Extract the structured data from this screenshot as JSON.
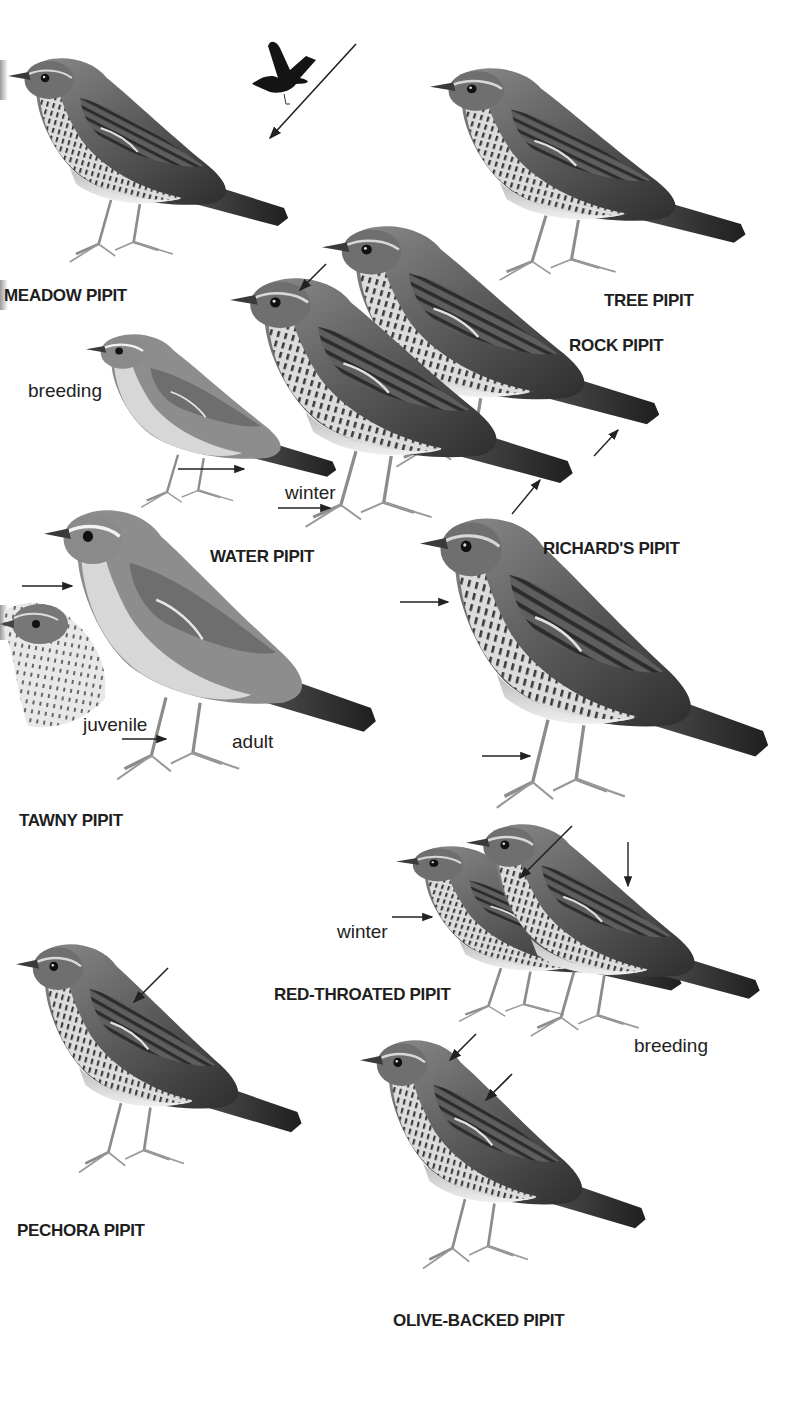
{
  "plate": {
    "background": "#ffffff",
    "ink": "#1e1e1e"
  },
  "species": [
    {
      "id": "meadow",
      "name": "MEADOW PIPIT",
      "label_pos": [
        4,
        286
      ]
    },
    {
      "id": "tree",
      "name": "TREE PIPIT",
      "label_pos": [
        604,
        291
      ]
    },
    {
      "id": "rock",
      "name": "ROCK PIPIT",
      "label_pos": [
        569,
        336
      ]
    },
    {
      "id": "water",
      "name": "WATER PIPIT",
      "label_pos": [
        210,
        547
      ]
    },
    {
      "id": "richards",
      "name": "RICHARD'S PIPIT",
      "label_pos": [
        543,
        539
      ]
    },
    {
      "id": "tawny",
      "name": "TAWNY PIPIT",
      "label_pos": [
        19,
        811
      ]
    },
    {
      "id": "red-throated",
      "name": "RED-THROATED PIPIT",
      "label_pos": [
        274,
        985
      ]
    },
    {
      "id": "pechora",
      "name": "PECHORA PIPIT",
      "label_pos": [
        17,
        1221
      ]
    },
    {
      "id": "olive-backed",
      "name": "OLIVE-BACKED PIPIT",
      "label_pos": [
        393,
        1311
      ]
    }
  ],
  "annotations": [
    {
      "id": "water-breeding",
      "text": "breeding",
      "pos": [
        28,
        380
      ]
    },
    {
      "id": "water-winter",
      "text": "winter",
      "pos": [
        285,
        482
      ]
    },
    {
      "id": "tawny-juvenile",
      "text": "juvenile",
      "pos": [
        83,
        714
      ]
    },
    {
      "id": "tawny-adult",
      "text": "adult",
      "pos": [
        232,
        731
      ]
    },
    {
      "id": "red-throated-winter",
      "text": "winter",
      "pos": [
        337,
        921
      ]
    },
    {
      "id": "red-throated-breeding",
      "text": "breeding",
      "pos": [
        634,
        1035
      ]
    }
  ]
}
